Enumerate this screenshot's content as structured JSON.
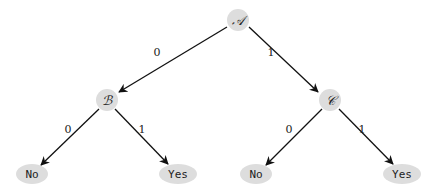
{
  "diagram": {
    "type": "binary-decision-tree",
    "nodes": {
      "A": {
        "label": "𝒜",
        "x": 238,
        "y": 20
      },
      "B": {
        "label": "ℬ",
        "x": 107,
        "y": 100
      },
      "C": {
        "label": "𝒞",
        "x": 330,
        "y": 100
      },
      "leaf1": {
        "label": "No",
        "x": 29,
        "y": 173
      },
      "leaf2": {
        "label": "Yes",
        "x": 177,
        "y": 173
      },
      "leaf3": {
        "label": "No",
        "x": 255,
        "y": 173
      },
      "leaf4": {
        "label": "Yes",
        "x": 402,
        "y": 173
      }
    },
    "edges": [
      {
        "from": "A",
        "to": "B",
        "label": "0"
      },
      {
        "from": "A",
        "to": "C",
        "label": "1"
      },
      {
        "from": "B",
        "to": "leaf1",
        "label": "0"
      },
      {
        "from": "B",
        "to": "leaf2",
        "label": "1"
      },
      {
        "from": "C",
        "to": "leaf3",
        "label": "0"
      },
      {
        "from": "C",
        "to": "leaf4",
        "label": "1"
      }
    ],
    "colors": {
      "node_fill": "#dddddd",
      "edge": "#111111"
    }
  }
}
